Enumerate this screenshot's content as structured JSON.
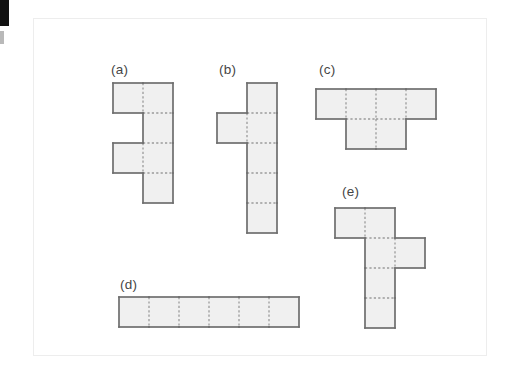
{
  "figure": {
    "background_color": "#ffffff",
    "panel": {
      "border_color": "#ededed",
      "fill_color": "#ffffff",
      "x": 33,
      "y": 18,
      "width": 454,
      "height": 338
    },
    "edge_mark": {
      "color": "#121212"
    },
    "style": {
      "cell_fill": "#f0f0f0",
      "outline_color": "#6e6e6e",
      "grid_color": "#9a9a9a",
      "label_color": "#454545",
      "cell_size": 30
    },
    "shapes": [
      {
        "id": "a",
        "label": "(a)",
        "label_x": 110,
        "label_y": 62,
        "origin_x": 112,
        "origin_y": 82,
        "cols": 2,
        "rows": 4,
        "cells": [
          [
            1,
            0
          ],
          [
            1,
            1
          ],
          [
            0,
            0
          ],
          [
            1,
            2
          ],
          [
            0,
            2
          ],
          [
            1,
            3
          ]
        ],
        "cell_count": 6,
        "description": "four-cell vertical column on the right with single cells attached on the left at the first and third rows"
      },
      {
        "id": "b",
        "label": "(b)",
        "label_x": 218,
        "label_y": 62,
        "origin_x": 216,
        "origin_y": 82,
        "cols": 2,
        "rows": 5,
        "cells": [
          [
            1,
            0
          ],
          [
            1,
            1
          ],
          [
            0,
            1
          ],
          [
            1,
            2
          ],
          [
            1,
            3
          ],
          [
            1,
            4
          ]
        ],
        "cell_count": 6,
        "description": "five-cell vertical column on the right with one cell attached on the left at the second row"
      },
      {
        "id": "c",
        "label": "(c)",
        "label_x": 318,
        "label_y": 62,
        "origin_x": 315,
        "origin_y": 88,
        "cols": 4,
        "rows": 2,
        "cells": [
          [
            0,
            0
          ],
          [
            1,
            0
          ],
          [
            2,
            0
          ],
          [
            3,
            0
          ],
          [
            1,
            1
          ],
          [
            2,
            1
          ]
        ],
        "cell_count": 6,
        "description": "row of four cells with two cells below beneath the middle two"
      },
      {
        "id": "d",
        "label": "(d)",
        "label_x": 119,
        "label_y": 277,
        "origin_x": 118,
        "origin_y": 296,
        "cols": 6,
        "rows": 1,
        "cells": [
          [
            0,
            0
          ],
          [
            1,
            0
          ],
          [
            2,
            0
          ],
          [
            3,
            0
          ],
          [
            4,
            0
          ],
          [
            5,
            0
          ]
        ],
        "cell_count": 6,
        "description": "single horizontal strip of six cells"
      },
      {
        "id": "e",
        "label": "(e)",
        "label_x": 341,
        "label_y": 184,
        "origin_x": 334,
        "origin_y": 207,
        "cols": 3,
        "rows": 4,
        "cells": [
          [
            0,
            0
          ],
          [
            1,
            0
          ],
          [
            1,
            1
          ],
          [
            2,
            1
          ],
          [
            1,
            2
          ],
          [
            1,
            3
          ]
        ],
        "cell_count": 6,
        "description": "four-cell vertical column with one cell attached left at the top row and one cell attached right at the second row"
      }
    ]
  }
}
